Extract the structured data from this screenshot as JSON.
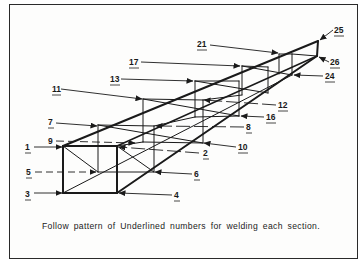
{
  "diagram": {
    "caption": "Follow pattern of Underlined numbers for welding each section.",
    "colors": {
      "line": "#1a1a1a",
      "background": "#ffffff"
    },
    "callouts": [
      {
        "id": "1",
        "label": "1",
        "x": 25,
        "y": 150
      },
      {
        "id": "2",
        "label": "2",
        "x": 203,
        "y": 156
      },
      {
        "id": "3",
        "label": "3",
        "x": 25,
        "y": 197
      },
      {
        "id": "4",
        "label": "4",
        "x": 174,
        "y": 198
      },
      {
        "id": "5",
        "label": "5",
        "x": 25,
        "y": 175
      },
      {
        "id": "6",
        "label": "6",
        "x": 194,
        "y": 177
      },
      {
        "id": "7",
        "label": "7",
        "x": 47,
        "y": 125
      },
      {
        "id": "8",
        "label": "8",
        "x": 246,
        "y": 130
      },
      {
        "id": "9",
        "label": "9",
        "x": 47,
        "y": 144
      },
      {
        "id": "10",
        "label": "10",
        "x": 238,
        "y": 150
      },
      {
        "id": "11",
        "label": "11",
        "x": 51,
        "y": 92
      },
      {
        "id": "12",
        "label": "12",
        "x": 278,
        "y": 108
      },
      {
        "id": "13",
        "label": "13",
        "x": 109,
        "y": 82
      },
      {
        "id": "16",
        "label": "16",
        "x": 266,
        "y": 120
      },
      {
        "id": "17",
        "label": "17",
        "x": 128,
        "y": 65
      },
      {
        "id": "21",
        "label": "21",
        "x": 197,
        "y": 47
      },
      {
        "id": "24",
        "label": "24",
        "x": 325,
        "y": 79
      },
      {
        "id": "25",
        "label": "25",
        "x": 334,
        "y": 33
      },
      {
        "id": "26",
        "label": "26",
        "x": 329,
        "y": 64
      }
    ]
  }
}
